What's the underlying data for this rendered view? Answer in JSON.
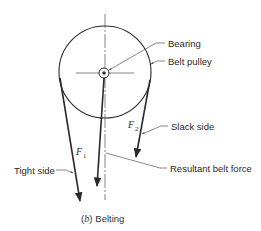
{
  "diagram": {
    "caption": {
      "prefix": "(",
      "letter": "b",
      "suffix": ")",
      "title": "Belting"
    },
    "labels": {
      "bearing": "Bearing",
      "belt_pulley": "Belt pulley",
      "slack_side": "Slack side",
      "tight_side": "Tight side",
      "resultant": "Resultant belt force"
    },
    "forces": {
      "f1": {
        "symbol": "F",
        "subscript": "1"
      },
      "f2": {
        "symbol": "F",
        "subscript": "2"
      }
    },
    "colors": {
      "line": "#2a2a2a",
      "leader": "#555555",
      "centerline": "#666666"
    }
  }
}
